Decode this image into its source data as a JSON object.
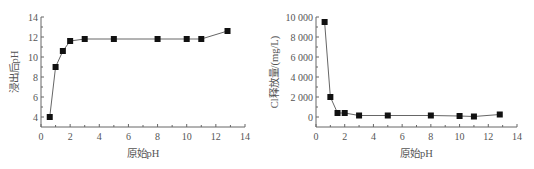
{
  "chart_data": [
    {
      "type": "line",
      "title": "",
      "xlabel": "原始pH",
      "ylabel": "浸出后pH",
      "xlim": [
        0,
        14
      ],
      "ylim": [
        3,
        14
      ],
      "xticks": [
        0,
        2,
        4,
        6,
        8,
        10,
        12,
        14
      ],
      "yticks": [
        4,
        6,
        8,
        10,
        12,
        14
      ],
      "ytick_labels": [
        "4",
        "6",
        "8",
        "10",
        "12",
        "14"
      ],
      "grid": false,
      "legend": null,
      "marker": "square",
      "x": [
        0.6,
        1.0,
        1.5,
        2.0,
        3.0,
        5.0,
        8.0,
        10.0,
        11.0,
        12.8
      ],
      "series": [
        {
          "name": "浸出后pH",
          "values": [
            4.0,
            9.0,
            10.6,
            11.6,
            11.8,
            11.8,
            11.8,
            11.8,
            11.8,
            12.6
          ]
        }
      ]
    },
    {
      "type": "line",
      "title": "",
      "xlabel": "原始pH",
      "ylabel": "Cl释放量/(mg/L)",
      "xlim": [
        0,
        14
      ],
      "ylim": [
        -1000,
        10000
      ],
      "xticks": [
        0,
        2,
        4,
        6,
        8,
        10,
        12,
        14
      ],
      "yticks": [
        0,
        2000,
        4000,
        6000,
        8000,
        10000
      ],
      "ytick_labels": [
        "0",
        "2 000",
        "4 000",
        "6 000",
        "8 000",
        "10 000"
      ],
      "grid": false,
      "legend": null,
      "marker": "square",
      "x": [
        0.6,
        1.0,
        1.5,
        2.0,
        3.0,
        5.0,
        8.0,
        10.0,
        11.0,
        12.8
      ],
      "series": [
        {
          "name": "Cl释放量",
          "values": [
            9500,
            2000,
            400,
            400,
            150,
            150,
            150,
            100,
            50,
            250
          ]
        }
      ]
    }
  ],
  "left": {
    "xlabel": "原始pH",
    "ylabel": "浸出后pH"
  },
  "right": {
    "xlabel": "原始pH",
    "ylabel": "Cl释放量/(mg/L)"
  }
}
